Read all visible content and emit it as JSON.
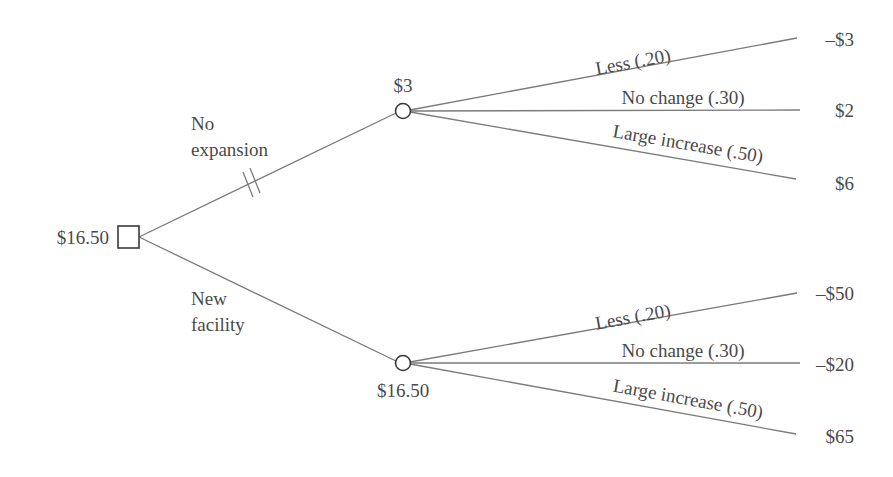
{
  "diagram": {
    "type": "decision-tree",
    "root": {
      "kind": "decision",
      "value": "$16.50",
      "branches": [
        {
          "label_line1": "No",
          "label_line2": "expansion",
          "pruned": true,
          "node": {
            "kind": "chance",
            "value": "$3",
            "outcomes": [
              {
                "label": "Less (.20)",
                "payoff": "–$3"
              },
              {
                "label": "No change (.30)",
                "payoff": "$2"
              },
              {
                "label": "Large increase (.50)",
                "payoff": "$6"
              }
            ]
          }
        },
        {
          "label_line1": "New",
          "label_line2": "facility",
          "pruned": false,
          "node": {
            "kind": "chance",
            "value": "$16.50",
            "outcomes": [
              {
                "label": "Less (.20)",
                "payoff": "–$50"
              },
              {
                "label": "No change (.30)",
                "payoff": "–$20"
              },
              {
                "label": "Large increase (.50)",
                "payoff": "$65"
              }
            ]
          }
        }
      ]
    }
  },
  "colors": {
    "line": "#7a7a7a",
    "node_stroke": "#3a3a3a",
    "text": "#4a4a4a",
    "background": "#ffffff"
  }
}
